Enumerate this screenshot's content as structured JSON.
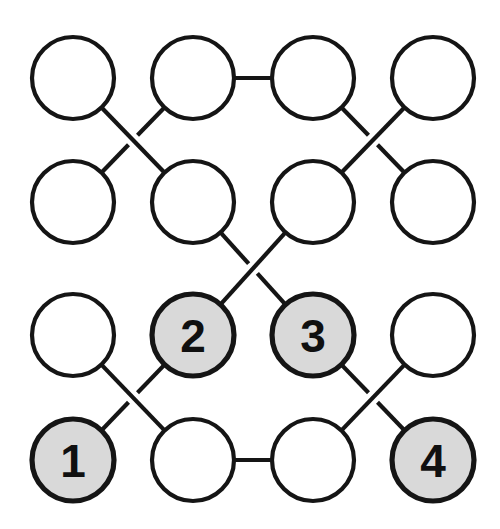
{
  "figure": {
    "kind": "node-link-diagram",
    "background_color": "#ffffff",
    "width": 500,
    "height": 529
  },
  "style": {
    "edge_color": "#151515",
    "edge_width": 4.2,
    "node_stroke_color": "#151515",
    "node_fill_plain": "#ffffff",
    "node_fill_shaded": "#d9d9d9",
    "label_color": "#101010",
    "node_radius": 41,
    "crossing_gap": 13
  },
  "grid": {
    "columns_x": [
      73,
      193,
      313,
      433
    ],
    "rows_y": [
      78,
      202,
      335,
      460
    ]
  },
  "nodes": [
    {
      "id": "r0c0",
      "row": 0,
      "col": 0,
      "cx": 73,
      "cy": 78,
      "shaded": false,
      "label": ""
    },
    {
      "id": "r0c1",
      "row": 0,
      "col": 1,
      "cx": 193,
      "cy": 78,
      "shaded": false,
      "label": ""
    },
    {
      "id": "r0c2",
      "row": 0,
      "col": 2,
      "cx": 313,
      "cy": 78,
      "shaded": false,
      "label": ""
    },
    {
      "id": "r0c3",
      "row": 0,
      "col": 3,
      "cx": 433,
      "cy": 78,
      "shaded": false,
      "label": ""
    },
    {
      "id": "r1c0",
      "row": 1,
      "col": 0,
      "cx": 73,
      "cy": 202,
      "shaded": false,
      "label": ""
    },
    {
      "id": "r1c1",
      "row": 1,
      "col": 1,
      "cx": 193,
      "cy": 202,
      "shaded": false,
      "label": ""
    },
    {
      "id": "r1c2",
      "row": 1,
      "col": 2,
      "cx": 313,
      "cy": 202,
      "shaded": false,
      "label": ""
    },
    {
      "id": "r1c3",
      "row": 1,
      "col": 3,
      "cx": 433,
      "cy": 202,
      "shaded": false,
      "label": ""
    },
    {
      "id": "r2c0",
      "row": 2,
      "col": 0,
      "cx": 73,
      "cy": 335,
      "shaded": false,
      "label": ""
    },
    {
      "id": "r2c1",
      "row": 2,
      "col": 1,
      "cx": 193,
      "cy": 335,
      "shaded": true,
      "label": "2"
    },
    {
      "id": "r2c2",
      "row": 2,
      "col": 2,
      "cx": 313,
      "cy": 335,
      "shaded": true,
      "label": "3"
    },
    {
      "id": "r2c3",
      "row": 2,
      "col": 3,
      "cx": 433,
      "cy": 335,
      "shaded": false,
      "label": ""
    },
    {
      "id": "r3c0",
      "row": 3,
      "col": 0,
      "cx": 73,
      "cy": 460,
      "shaded": true,
      "label": "1"
    },
    {
      "id": "r3c1",
      "row": 3,
      "col": 1,
      "cx": 193,
      "cy": 460,
      "shaded": false,
      "label": ""
    },
    {
      "id": "r3c2",
      "row": 3,
      "col": 2,
      "cx": 313,
      "cy": 460,
      "shaded": false,
      "label": ""
    },
    {
      "id": "r3c3",
      "row": 3,
      "col": 3,
      "cx": 433,
      "cy": 460,
      "shaded": true,
      "label": "4"
    }
  ],
  "labeled_nodes": [
    {
      "label": "1",
      "node_id": "r3c0"
    },
    {
      "label": "2",
      "node_id": "r2c1"
    },
    {
      "label": "3",
      "node_id": "r2c2"
    },
    {
      "label": "4",
      "node_id": "r3c3"
    }
  ],
  "edges": [
    {
      "from": "r0c1",
      "to": "r0c2",
      "kind": "horizontal",
      "over": true
    },
    {
      "from": "r3c1",
      "to": "r3c2",
      "kind": "horizontal",
      "over": true
    },
    {
      "from": "r0c0",
      "to": "r1c1",
      "kind": "diagonal",
      "over": true
    },
    {
      "from": "r0c1",
      "to": "r1c0",
      "kind": "diagonal",
      "over": false
    },
    {
      "from": "r0c2",
      "to": "r1c3",
      "kind": "diagonal",
      "over": false
    },
    {
      "from": "r0c3",
      "to": "r1c2",
      "kind": "diagonal",
      "over": true
    },
    {
      "from": "r1c1",
      "to": "r2c2",
      "kind": "diagonal",
      "over": false
    },
    {
      "from": "r1c2",
      "to": "r2c1",
      "kind": "diagonal",
      "over": true
    },
    {
      "from": "r2c0",
      "to": "r3c1",
      "kind": "diagonal",
      "over": true
    },
    {
      "from": "r2c1",
      "to": "r3c0",
      "kind": "diagonal",
      "over": false
    },
    {
      "from": "r2c2",
      "to": "r3c3",
      "kind": "diagonal",
      "over": false
    },
    {
      "from": "r2c3",
      "to": "r3c2",
      "kind": "diagonal",
      "over": true
    }
  ]
}
